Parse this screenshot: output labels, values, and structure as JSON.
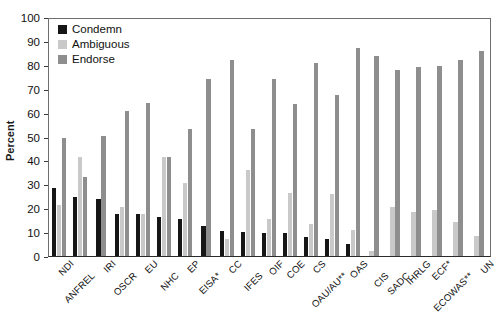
{
  "chart_data": {
    "type": "bar",
    "title": "",
    "xlabel": "",
    "ylabel": "Percent",
    "ylim": [
      0,
      100
    ],
    "ytick_step": 10,
    "yticks": [
      0,
      10,
      20,
      30,
      40,
      50,
      60,
      70,
      80,
      90,
      100
    ],
    "grid": false,
    "legend_position": "top-left",
    "categories": [
      "NDI",
      "ANFREL",
      "IRI",
      "OSCR",
      "EU",
      "NHC",
      "EP",
      "EISA*",
      "CC",
      "IFES",
      "OIF",
      "COE",
      "CS",
      "OAU/AU**",
      "OAS",
      "CIS",
      "SADC",
      "IHRLG",
      "ECF*",
      "ECOWAS**",
      "UN"
    ],
    "series": [
      {
        "name": "Condemn",
        "color": "#161616",
        "values": [
          28.5,
          25.0,
          24.0,
          17.5,
          17.5,
          16.5,
          15.5,
          12.5,
          10.5,
          10.0,
          9.5,
          9.5,
          8.0,
          7.0,
          5.0,
          0.0,
          0.0,
          0.0,
          0.0,
          0.0,
          0.0
        ]
      },
      {
        "name": "Ambiguous",
        "color": "#c9c9c9",
        "values": [
          21.5,
          41.5,
          0.0,
          20.5,
          17.5,
          41.5,
          30.5,
          0.0,
          7.0,
          36.0,
          15.5,
          26.5,
          13.5,
          26.0,
          11.0,
          2.0,
          20.5,
          18.5,
          19.5,
          14.5,
          8.5
        ]
      },
      {
        "name": "Endorse",
        "color": "#8e8e8e",
        "values": [
          49.5,
          33.0,
          50.5,
          61.0,
          64.5,
          41.5,
          53.5,
          74.5,
          82.5,
          53.5,
          74.5,
          64.0,
          81.0,
          67.5,
          87.5,
          84.0,
          78.0,
          79.5,
          80.0,
          82.5,
          86.0
        ]
      }
    ],
    "last_bar_extra": {
      "label": "UN",
      "endorse": 91.0
    }
  },
  "legend": {
    "items": [
      {
        "label": "Condemn",
        "key": "condemn"
      },
      {
        "label": "Ambiguous",
        "key": "ambiguous"
      },
      {
        "label": "Endorse",
        "key": "endorse"
      }
    ]
  },
  "axis": {
    "y_title": "Percent"
  }
}
